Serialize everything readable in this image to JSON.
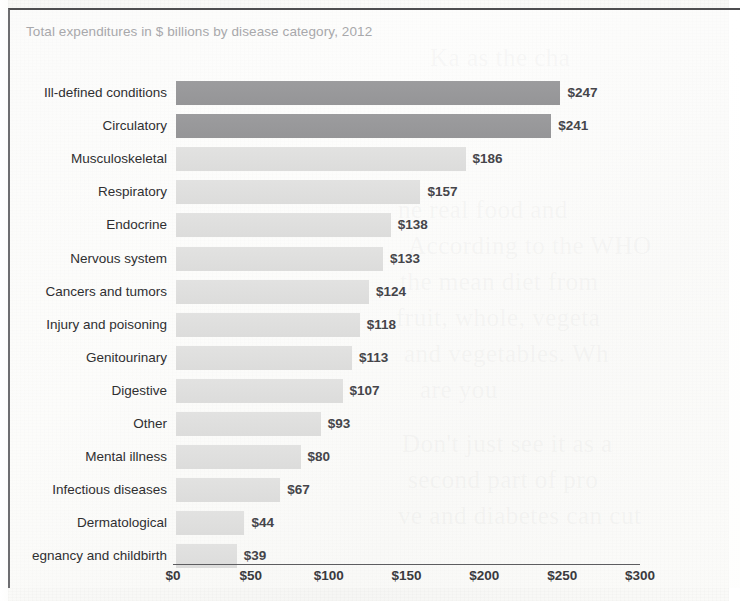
{
  "chart": {
    "title": "Total expenditures in $ billions by disease category, 2012"
  },
  "axis": {
    "ticks": [
      "$0",
      "$50",
      "$100",
      "$150",
      "$200",
      "$250",
      "$300"
    ]
  },
  "background_bleed": [
    {
      "text": "Ka as the cha",
      "x": 430,
      "y": 44
    },
    {
      "text": "to he",
      "x": 415,
      "y": 80
    },
    {
      "text": "the",
      "x": 418,
      "y": 114
    },
    {
      "text": "ne real food and",
      "x": 398,
      "y": 196
    },
    {
      "text": "According to the WHO",
      "x": 408,
      "y": 232
    },
    {
      "text": "the mean diet from",
      "x": 400,
      "y": 268
    },
    {
      "text": "fruit, whole, vegeta",
      "x": 396,
      "y": 304
    },
    {
      "text": "and vegetables. Wh",
      "x": 404,
      "y": 340
    },
    {
      "text": "are you",
      "x": 420,
      "y": 376
    },
    {
      "text": "Don't just see it as a",
      "x": 402,
      "y": 430
    },
    {
      "text": "second part of pro",
      "x": 408,
      "y": 466
    },
    {
      "text": "ve and diabetes can cut",
      "x": 398,
      "y": 502
    }
  ],
  "chart_data": {
    "type": "bar",
    "orientation": "horizontal",
    "title": "Total expenditures in $ billions by disease category, 2012",
    "xlabel": "",
    "ylabel": "",
    "xlim": [
      0,
      300
    ],
    "grid": false,
    "legend": "none",
    "value_prefix": "$",
    "categories": [
      "Ill-defined conditions",
      "Circulatory",
      "Musculoskeletal",
      "Respiratory",
      "Endocrine",
      "Nervous system",
      "Cancers and tumors",
      "Injury and poisoning",
      "Genitourinary",
      "Digestive",
      "Other",
      "Mental illness",
      "Infectious diseases",
      "Dermatological",
      "egnancy and childbirth"
    ],
    "values": [
      247,
      241,
      186,
      157,
      138,
      133,
      124,
      118,
      113,
      107,
      93,
      80,
      67,
      44,
      39
    ],
    "value_labels": [
      "$247",
      "$241",
      "$186",
      "$157",
      "$138",
      "$133",
      "$124",
      "$118",
      "$113",
      "$107",
      "$93",
      "$80",
      "$67",
      "$44",
      "$39"
    ],
    "bar_colors": [
      "#989898",
      "#989898",
      "#e0e0df",
      "#e0e0df",
      "#e0e0df",
      "#e0e0df",
      "#e0e0df",
      "#e0e0df",
      "#e0e0df",
      "#e0e0df",
      "#e0e0df",
      "#e0e0df",
      "#e0e0df",
      "#e0e0df",
      "#e0e0df"
    ],
    "highlight_color": "#989898",
    "base_color": "#e0e0df"
  }
}
